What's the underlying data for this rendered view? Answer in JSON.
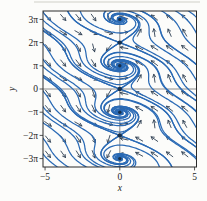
{
  "figure": {
    "background": "#fcfcfa",
    "page_rule_color": "#cfcfc8"
  },
  "chart_data": {
    "type": "direction-field-phase-portrait",
    "title": "",
    "xlabel": "x",
    "ylabel": "y",
    "xlim": [
      -5.14,
      5.13
    ],
    "ylim_pi": [
      -3.36,
      3.36
    ],
    "x_ticks": [
      {
        "value": -5,
        "label": "−5"
      },
      {
        "value": 0,
        "label": "0"
      },
      {
        "value": 5,
        "label": "5"
      }
    ],
    "y_ticks": [
      {
        "value_pi": 3,
        "label": "3π"
      },
      {
        "value_pi": 2,
        "label": "2π"
      },
      {
        "value_pi": 1,
        "label": "π"
      },
      {
        "value_pi": 0,
        "label": "0"
      },
      {
        "value_pi": -1,
        "label": "−π"
      },
      {
        "value_pi": -2,
        "label": "−2π"
      },
      {
        "value_pi": -3,
        "label": "−3π"
      }
    ],
    "field_model": {
      "dx_dt": "sin(y) - 0.5*x",
      "dy_dt": "x",
      "damping": 0.5,
      "left_half_arrow_direction": "down-right",
      "right_half_arrow_direction": "up-left"
    },
    "equilibria": [
      {
        "x": 0,
        "y_pi": 3,
        "type": "spiral"
      },
      {
        "x": 0,
        "y_pi": 2,
        "type": "saddle"
      },
      {
        "x": 0,
        "y_pi": 1,
        "type": "spiral"
      },
      {
        "x": 0,
        "y_pi": 0,
        "type": "saddle"
      },
      {
        "x": 0,
        "y_pi": -1,
        "type": "spiral"
      },
      {
        "x": 0,
        "y_pi": -2,
        "type": "saddle"
      },
      {
        "x": 0,
        "y_pi": -3,
        "type": "spiral"
      }
    ],
    "arrow_grid": {
      "x0": 48,
      "dx": 15.2,
      "cols": 10,
      "y0": 17.5,
      "dy": 15.2,
      "rows": 10,
      "length": 8,
      "barb": 3.2
    },
    "seeds": {
      "left_edge": {
        "x": -5.12,
        "y_pi": [
          3.3,
          2.62,
          1.94,
          1.26,
          0.58,
          -0.1,
          -0.78,
          -1.46,
          -2.14,
          -2.82
        ]
      },
      "right_edge": {
        "x": 5.12,
        "y_pi": [
          3.1,
          2.42,
          1.74,
          1.06,
          0.38,
          -0.3,
          -0.98,
          -1.66,
          -2.34,
          -3.02
        ]
      },
      "focus_arm_offsets": [
        {
          "dx": 0.15,
          "dy": 0.05
        },
        {
          "dx": -0.15,
          "dy": -0.05
        }
      ],
      "saddle_arm_offsets": [
        {
          "dx": 0.093,
          "dy": 0.119
        },
        {
          "dx": -0.093,
          "dy": -0.119
        },
        {
          "dx": 0.094,
          "dy": -0.073
        },
        {
          "dx": -0.094,
          "dy": 0.073
        }
      ]
    },
    "layout": {
      "cx": 119.8,
      "cy": 89,
      "px_per_x": 14.95,
      "px_per_y": 7.384,
      "frame": {
        "x": 43,
        "y": 11,
        "w": 153.5,
        "h": 156
      },
      "legend": "none",
      "grid": "off"
    },
    "colors": {
      "curve": "#2a6ab5",
      "arrow": "#2f3f52",
      "inner_axis": "#6e6e6e",
      "frame": "#2b2b2b",
      "dot_dark": "#16304d",
      "dot_spiral": "#2a6ab5",
      "label": "#1b1b1b"
    }
  }
}
